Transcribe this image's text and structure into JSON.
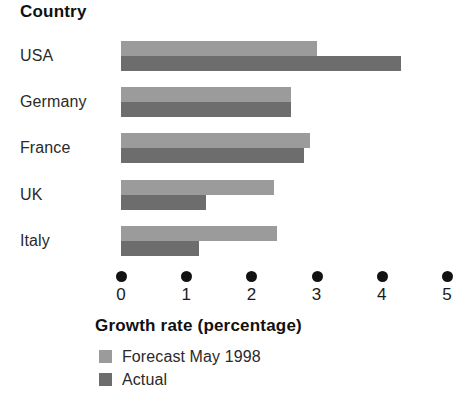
{
  "chart_data": {
    "type": "bar",
    "orientation": "horizontal",
    "title": "",
    "category_axis_title": "Country",
    "value_axis_title": "Growth rate (percentage)",
    "categories": [
      "USA",
      "Germany",
      "France",
      "UK",
      "Italy"
    ],
    "series": [
      {
        "name": "Forecast May 1998",
        "color": "#9b9b9b",
        "values": [
          3.0,
          2.6,
          2.9,
          2.35,
          2.4
        ]
      },
      {
        "name": "Actual",
        "color": "#6d6d6d",
        "values": [
          4.3,
          2.6,
          2.8,
          1.3,
          1.2
        ]
      }
    ],
    "xlabel": "Growth rate (percentage)",
    "ylabel": "Country",
    "xlim": [
      0,
      5
    ],
    "xticks": [
      0,
      1,
      2,
      3,
      4,
      5
    ],
    "xtick_labels": [
      "0",
      "1",
      "2",
      "3",
      "4",
      "5"
    ],
    "grid": false,
    "legend_position": "bottom-left",
    "tick_marker_style": "dot"
  },
  "legend": {
    "items": [
      {
        "label": "Forecast May 1998",
        "swatch": "forecast"
      },
      {
        "label": "Actual",
        "swatch": "actual"
      }
    ]
  }
}
